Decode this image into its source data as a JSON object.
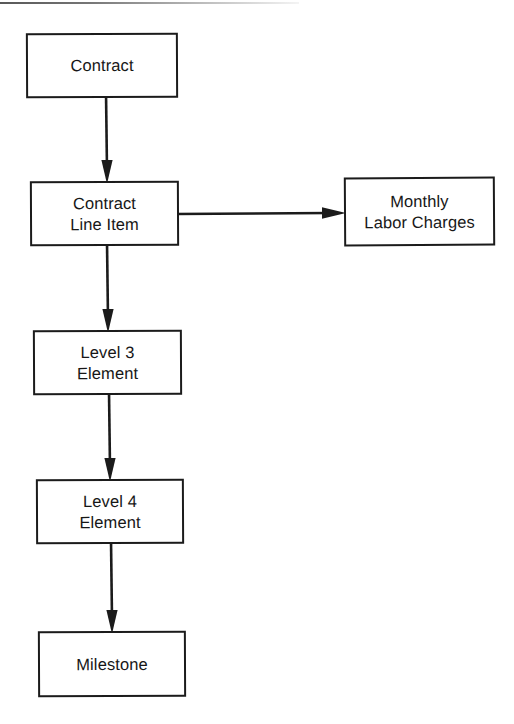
{
  "diagram": {
    "type": "flowchart",
    "background_color": "#ffffff",
    "stroke_color": "#1b1b1b",
    "text_color": "#171717",
    "nodes": [
      {
        "id": "contract",
        "label": "Contract",
        "shape": "rectangle"
      },
      {
        "id": "contract_line",
        "label": "Contract\nLine Item",
        "shape": "rectangle"
      },
      {
        "id": "monthly_labor",
        "label": "Monthly\nLabor Charges",
        "shape": "rectangle"
      },
      {
        "id": "level3",
        "label": "Level 3\nElement",
        "shape": "rectangle"
      },
      {
        "id": "level4",
        "label": "Level 4\nElement",
        "shape": "rectangle"
      },
      {
        "id": "milestone",
        "label": "Milestone",
        "shape": "rectangle"
      }
    ],
    "edges": [
      {
        "id": "e1",
        "from": "contract",
        "to": "contract_line",
        "direction": "down",
        "arrowhead": "filled"
      },
      {
        "id": "e2",
        "from": "contract_line",
        "to": "monthly_labor",
        "direction": "right",
        "arrowhead": "filled"
      },
      {
        "id": "e3",
        "from": "contract_line",
        "to": "level3",
        "direction": "down",
        "arrowhead": "filled"
      },
      {
        "id": "e4",
        "from": "level3",
        "to": "level4",
        "direction": "down",
        "arrowhead": "filled"
      },
      {
        "id": "e5",
        "from": "level4",
        "to": "milestone",
        "direction": "down",
        "arrowhead": "filled"
      }
    ]
  }
}
